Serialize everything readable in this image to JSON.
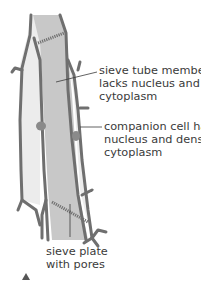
{
  "figure": {
    "labels": {
      "sieve_tube": [
        "sieve tube member",
        "lacks nucleus and",
        "cytoplasm"
      ],
      "companion": [
        "companion cell has",
        "nucleus and dense",
        "cytoplasm"
      ],
      "sieve_plate": [
        "sieve plate",
        "with pores"
      ]
    },
    "colors": {
      "cell_wall": "#6f6f6f",
      "sieve_tube_fill": "#c8c8c8",
      "companion_fill": "#ececec",
      "nucleus": "#8a8a8a",
      "text": "#3a3a3a",
      "marker": "#555555"
    }
  }
}
